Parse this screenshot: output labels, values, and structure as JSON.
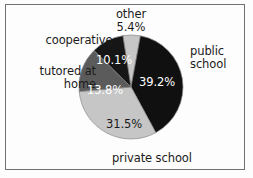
{
  "frame": {
    "border_color": "#6f7173",
    "background": "#fdfdfd"
  },
  "chart_data": {
    "type": "pie",
    "title": "",
    "subtitle": "",
    "xlabel": "",
    "ylabel": "",
    "grid": false,
    "legend_position": "outside-labels",
    "units": "percent",
    "total": 100.0,
    "start_angle_deg": -9,
    "direction": "clockwise",
    "center": {
      "x": 131,
      "y": 87
    },
    "radius": 52,
    "categories": [
      "other",
      "public school",
      "private school",
      "tutored at home",
      "cooperative"
    ],
    "values": [
      5.4,
      39.2,
      31.5,
      13.8,
      10.1
    ],
    "slices": [
      {
        "label": "other",
        "value": 5.4,
        "value_label": "5.4%",
        "color": "#c6c6c6",
        "value_label_color": "#1b1b1b",
        "label_lines": [
          "other",
          "5.4%"
        ],
        "label_position": "above"
      },
      {
        "label": "public school",
        "value": 39.2,
        "value_label": "39.2%",
        "color": "#101010",
        "value_label_color": "#ffffff",
        "label_lines": [
          "public",
          "school"
        ],
        "label_position": "right"
      },
      {
        "label": "private school",
        "value": 31.5,
        "value_label": "31.5%",
        "color": "#c6c6c6",
        "value_label_color": "#1b1b1b",
        "label_lines": [
          "private school"
        ],
        "label_position": "below"
      },
      {
        "label": "tutored at home",
        "value": 13.8,
        "value_label": "13.8%",
        "color": "#5b5b5b",
        "value_label_color": "#ffffff",
        "label_lines": [
          "tutored at",
          "home"
        ],
        "label_position": "left"
      },
      {
        "label": "cooperative",
        "value": 10.1,
        "value_label": "10.1%",
        "color": "#161616",
        "value_label_color": "#ffffff",
        "label_lines": [
          "cooperative"
        ],
        "label_position": "upper-left"
      }
    ]
  },
  "labels": {
    "other": "other\n5.4%",
    "cooperative": "cooperative",
    "tutored_at_home": "tutored at\nhome",
    "public_school": "public\nschool",
    "private_school": "private school"
  },
  "percent_labels": {
    "other": "5.4%",
    "public_school": "39.2%",
    "private_school": "31.5%",
    "tutored_at_home": "13.8%",
    "cooperative": "10.1%"
  }
}
